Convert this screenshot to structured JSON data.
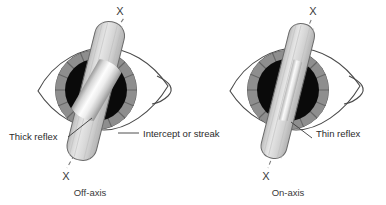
{
  "figure": {
    "background_color": "#ffffff",
    "width": 386,
    "height": 205
  },
  "colors": {
    "pupil": "#0a0a0a",
    "iris_ring": "#8f8f8f",
    "iris_ring_dark": "#6e6e6e",
    "streak_body": "#d8d8d8",
    "streak_outline": "#6a6a6a",
    "reflex_light": "#fbfbfb",
    "eyelid_outline": "#4a4a4a",
    "label_text": "#2b2b2b",
    "dashed_line": "#7a7a7a"
  },
  "panels": [
    {
      "id": "left",
      "caption": "Off-axis",
      "axis_marker_top": "X",
      "axis_marker_bottom": "X",
      "labels": [
        {
          "id": "thick-reflex",
          "text": "Thick reflex"
        },
        {
          "id": "intercept",
          "text": "Intercept or streak"
        }
      ],
      "streak_tilt_deg": 14,
      "reflex_tilt_deg": 30,
      "reflex_width_px": 13
    },
    {
      "id": "right",
      "caption": "On-axis",
      "axis_marker_top": "X",
      "axis_marker_bottom": "X",
      "labels": [
        {
          "id": "thin-reflex",
          "text": "Thin reflex"
        }
      ],
      "streak_tilt_deg": 14,
      "reflex_tilt_deg": 14,
      "reflex_width_px": 5
    }
  ]
}
